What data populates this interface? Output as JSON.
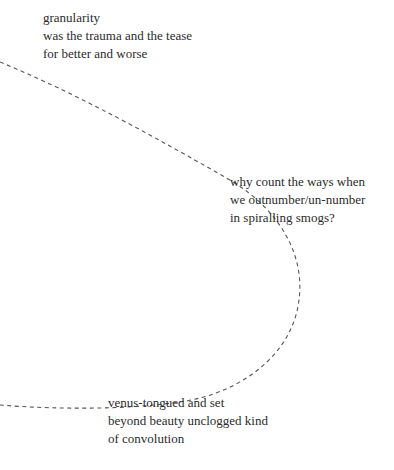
{
  "poem": {
    "stanzas": [
      {
        "lines": [
          "granularity",
          "was the trauma and the tease",
          "for better and worse"
        ]
      },
      {
        "lines": [
          "why count the ways when",
          "we outnumber/un-number",
          "in spiralling smogs?"
        ]
      },
      {
        "lines": [
          "venus-tongued and set",
          "beyond beauty unclogged kind",
          "of convolution"
        ]
      }
    ]
  },
  "style": {
    "text_color": "#2b2b2b",
    "curve_color": "#555555"
  }
}
